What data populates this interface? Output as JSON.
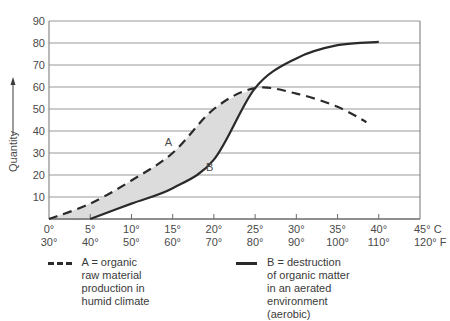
{
  "chart_data": {
    "type": "line",
    "title": "",
    "xlabel": "Temperature (°C / °F)",
    "ylabel": "Quantity",
    "ylim": [
      0,
      90
    ],
    "xlim": [
      0,
      45
    ],
    "grid": true,
    "y_ticks": [
      10,
      20,
      30,
      40,
      50,
      60,
      70,
      80,
      90
    ],
    "x_ticks_c": [
      "0°",
      "5°",
      "10°",
      "15°",
      "20°",
      "25°",
      "30°",
      "35°",
      "40°",
      "45° C"
    ],
    "x_ticks_f": [
      "30°",
      "40°",
      "50°",
      "60°",
      "70°",
      "80°",
      "90°",
      "100°",
      "110°",
      "120° F"
    ],
    "x": [
      0,
      5,
      10,
      15,
      20,
      25,
      30,
      35,
      38.5,
      40
    ],
    "series": [
      {
        "name": "A = organic raw material production in humid climate",
        "label": "A",
        "style": "dashed",
        "points": [
          [
            0,
            0
          ],
          [
            5,
            7
          ],
          [
            10,
            17.5
          ],
          [
            15,
            30
          ],
          [
            20,
            50
          ],
          [
            25,
            59.5
          ],
          [
            30,
            57
          ],
          [
            35,
            51
          ],
          [
            38.5,
            44
          ]
        ]
      },
      {
        "name": "B = destruction of organic matter in an aerated environment (aerobic)",
        "label": "B",
        "style": "solid",
        "points": [
          [
            5,
            0
          ],
          [
            10,
            7
          ],
          [
            15,
            14
          ],
          [
            20,
            27
          ],
          [
            25,
            59.5
          ],
          [
            30,
            73
          ],
          [
            35,
            79
          ],
          [
            40,
            80.5
          ]
        ]
      }
    ],
    "annotations": [
      {
        "text": "A",
        "x": 14.5,
        "y": 33
      },
      {
        "text": "B",
        "x": 19.5,
        "y": 22
      }
    ],
    "shaded_region": "between A and B where A > B (0°–25°)",
    "legend_position": "bottom"
  },
  "legend": {
    "a_text": "A = organic raw material\nproduction in humid climate",
    "b_text": "B = destruction of organic matter\nin an aerated environment (aerobic)"
  },
  "axis": {
    "y_label": "Quantity"
  }
}
